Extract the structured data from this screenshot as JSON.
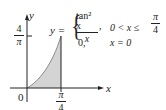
{
  "diagram": {
    "axes": {
      "x_label": "x",
      "y_label": "y",
      "origin_label": "0",
      "x_tick": {
        "num": "π",
        "den": "4"
      },
      "y_tick": {
        "num": "4",
        "den": "π"
      }
    },
    "function": {
      "lhs": "y =",
      "case1": {
        "expr_num": "tan² x",
        "expr_den": "x",
        "comma": ",",
        "condition": "0 < x ≤",
        "cond_num": "π",
        "cond_den": "4"
      },
      "case2": {
        "expr": "0,",
        "condition": "x = 0"
      }
    },
    "colors": {
      "shade": "#d4d4d4",
      "curve": "#8a8a8a",
      "axis": "#222222"
    }
  }
}
